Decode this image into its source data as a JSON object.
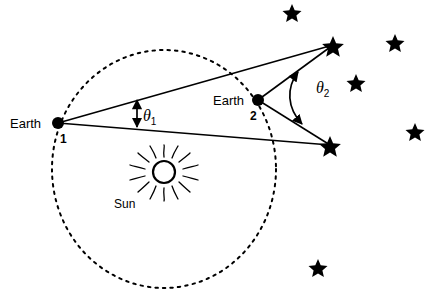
{
  "figure": {
    "background_color": "#ffffff",
    "stroke_color": "#000000",
    "width": 438,
    "height": 306
  },
  "labels": {
    "earth1": "Earth",
    "earth1_index": "1",
    "earth2": "Earth",
    "earth2_index": "2",
    "sun": "Sun",
    "theta1": "θ",
    "theta1_sub": "1",
    "theta2": "θ",
    "theta2_sub": "2"
  },
  "diagram_data": {
    "type": "schematic",
    "orbit": {
      "name": "earth-orbit",
      "shape": "ellipse",
      "center": [
        164,
        169
      ],
      "rx": 112,
      "ry": 119,
      "style": "dotted"
    },
    "sun": {
      "name": "sun",
      "center": [
        164,
        172
      ],
      "radius": 11,
      "ray_count": 16,
      "ray_inner": 15,
      "ray_outer": 27,
      "fill": "none"
    },
    "earth_positions": [
      {
        "name": "earth-1",
        "point": [
          58,
          123
        ],
        "radius": 6
      },
      {
        "name": "earth-2",
        "point": [
          258,
          100
        ],
        "radius": 6
      }
    ],
    "target_stars": [
      {
        "name": "star-upper-target",
        "point": [
          333,
          45
        ]
      },
      {
        "name": "star-right-target",
        "point": [
          330,
          145
        ]
      }
    ],
    "sight_lines": [
      {
        "from": [
          58,
          123
        ],
        "to": [
          333,
          45
        ]
      },
      {
        "from": [
          58,
          123
        ],
        "to": [
          330,
          145
        ]
      },
      {
        "from": [
          258,
          100
        ],
        "to": [
          333,
          45
        ]
      },
      {
        "from": [
          258,
          100
        ],
        "to": [
          330,
          145
        ]
      }
    ],
    "angle_markers": [
      {
        "name": "theta-1-marker",
        "style": "double-headed-straight-arrow",
        "from": [
          137,
          99
        ],
        "to": [
          137,
          128
        ]
      },
      {
        "name": "theta-2-marker",
        "style": "double-headed-arc",
        "from": [
          298,
          73
        ],
        "to": [
          303,
          123
        ],
        "bow": 22
      }
    ],
    "background_stars": [
      {
        "point": [
          292,
          12
        ]
      },
      {
        "point": [
          395,
          42
        ]
      },
      {
        "point": [
          356,
          82
        ]
      },
      {
        "point": [
          415,
          131
        ]
      },
      {
        "point": [
          318,
          267
        ]
      }
    ]
  }
}
